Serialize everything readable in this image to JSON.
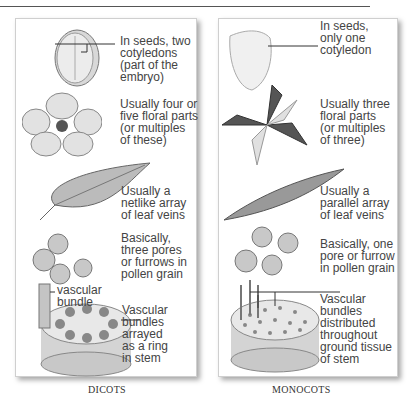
{
  "dicots": {
    "caption": "DICOTS",
    "seed": "In seeds, two\ncotyledons\n(part of the\nembryo)",
    "flower": "Usually four or\nfive floral parts\n(or multiples\nof these)",
    "leaf": "Usually a\nnetlike array\nof leaf veins",
    "pollen": "Basically,\nthree pores\nor furrows in\npollen grain",
    "bundle_label": "vascular\nbundle",
    "stem": "Vascular\nbundles\narrayed\nas a ring\nin stem"
  },
  "monocots": {
    "caption": "MONOCOTS",
    "seed": "In seeds,\nonly one\ncotyledon",
    "flower": "Usually three\nfloral parts\n(or multiples\nof three)",
    "leaf": "Usually a\nparallel array\nof leaf veins",
    "pollen": "Basically, one\npore or furrow\nin pollen grain",
    "stem": "Vascular\nbundles\ndistributed\nthroughout\nground tissue\nof stem"
  }
}
